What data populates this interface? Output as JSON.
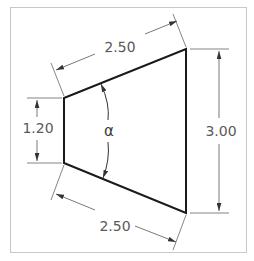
{
  "diagram": {
    "frame_color": "#c8c8c8",
    "shape_color": "#1a1a1a",
    "dim_color": "#555555",
    "dimensions": {
      "top_slant": "2.50",
      "bottom_slant": "2.50",
      "left_height": "1.20",
      "right_height": "3.00"
    },
    "angle_label": "α"
  }
}
